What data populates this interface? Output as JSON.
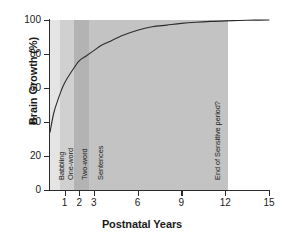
{
  "chart_data": {
    "type": "line",
    "title": "",
    "xlabel": "Postnatal Years",
    "ylabel": "Brain Growth (%)",
    "xlim": [
      0,
      15
    ],
    "ylim": [
      0,
      100
    ],
    "grid": false,
    "legend": "none",
    "x_ticks": [
      1,
      2,
      3,
      6,
      9,
      12,
      15
    ],
    "x_tick_labels": [
      "1",
      "2",
      "3",
      "6",
      "9",
      "12",
      "15"
    ],
    "y_ticks": [
      0,
      20,
      40,
      60,
      80,
      100
    ],
    "y_tick_labels": [
      "0",
      "20",
      "40",
      "60",
      "80",
      "100"
    ],
    "series": [
      {
        "name": "Brain Growth",
        "x": [
          0,
          0.25,
          0.5,
          0.75,
          1,
          1.5,
          2,
          2.5,
          3,
          3.5,
          4,
          5,
          6,
          7,
          8,
          9,
          10,
          11,
          12,
          13,
          14,
          15
        ],
        "values": [
          34,
          45,
          52,
          58,
          63,
          70,
          76,
          79,
          82,
          85,
          87,
          91,
          94,
          96,
          97,
          98,
          98.7,
          99.2,
          99.5,
          99.7,
          99.9,
          100
        ]
      }
    ],
    "annotations": [
      {
        "label": "Babbling",
        "x_start": 0,
        "x_end": 0.65,
        "shade": "#e2e2e2"
      },
      {
        "label": "One-word",
        "x_start": 0.65,
        "x_end": 1.6,
        "shade": "#cfcfcf"
      },
      {
        "label": "Two-word",
        "x_start": 1.6,
        "x_end": 2.6,
        "shade": "#b4b4b4"
      },
      {
        "label": "Sentences",
        "x_start": 2.6,
        "x_end": 12.2,
        "shade": "#c4c4c4"
      },
      {
        "label": "End of Sensitive period?",
        "x_start": 11.3,
        "x_end": 12.2,
        "shade": "#c4c4c4"
      }
    ]
  },
  "bands": [
    {
      "label": "Babbling",
      "left_px": 50,
      "width_px": 10,
      "color": "#e4e4e4",
      "label_x": 57,
      "label_y": 180
    },
    {
      "label": "One-word",
      "left_px": 60,
      "width_px": 14,
      "color": "#d0d0d0",
      "label_x": 66,
      "label_y": 180
    },
    {
      "label": "Two-word",
      "left_px": 74,
      "width_px": 15,
      "color": "#b3b3b3",
      "label_x": 80,
      "label_y": 180
    },
    {
      "label": "Sentences",
      "left_px": 89,
      "width_px": 139,
      "color": "#c3c3c3",
      "label_x": 96,
      "label_y": 180
    },
    {
      "label": "End of Sensitive period?",
      "left_px": 0,
      "width_px": 0,
      "color": "transparent",
      "label_x": 213,
      "label_y": 180
    }
  ],
  "y_tick_positions": [
    {
      "label": "100",
      "top_px": 20
    },
    {
      "label": "80",
      "top_px": 54
    },
    {
      "label": "60",
      "top_px": 88
    },
    {
      "label": "40",
      "top_px": 122
    },
    {
      "label": "20",
      "top_px": 156
    },
    {
      "label": "0",
      "top_px": 190
    }
  ],
  "x_tick_positions": [
    {
      "label": "1",
      "left_px": 64.6
    },
    {
      "label": "2",
      "left_px": 79.2
    },
    {
      "label": "3",
      "left_px": 93.8
    },
    {
      "label": "6",
      "left_px": 137.6
    },
    {
      "label": "9",
      "left_px": 181.4
    },
    {
      "label": "12",
      "left_px": 225.2
    },
    {
      "label": "15",
      "left_px": 269.0
    }
  ],
  "colors": {
    "axis": "#2b2b2b",
    "curve": "#2b2b2b",
    "text": "#1a1a1a",
    "background": "#ffffff"
  }
}
